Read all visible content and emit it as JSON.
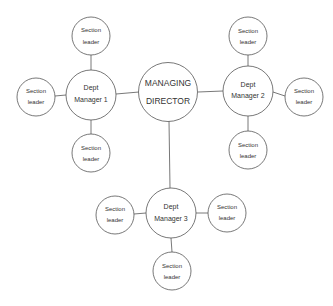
{
  "diagram": {
    "type": "organizational-chart",
    "colors": {
      "stroke": "#555555",
      "text": "#333333",
      "background": "#ffffff"
    },
    "center": {
      "line1": "MANAGING",
      "line2": "DIRECTOR"
    },
    "managers": [
      {
        "line1": "Dept",
        "line2": "Manager 1"
      },
      {
        "line1": "Dept",
        "line2": "Manager 2"
      },
      {
        "line1": "Dept",
        "line2": "Manager 3"
      }
    ],
    "leader": {
      "line1": "Section",
      "line2": "leader"
    }
  }
}
